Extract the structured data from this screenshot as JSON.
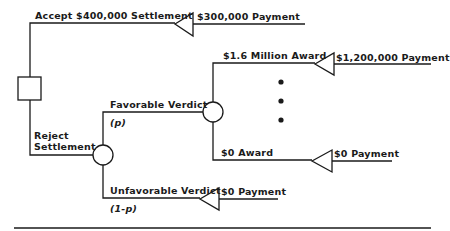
{
  "diagram": {
    "type": "decision-tree",
    "nodes": {
      "decision": {
        "shape": "square",
        "label": ""
      },
      "trial_chance": {
        "shape": "circle",
        "label": ""
      },
      "award_chance": {
        "shape": "circle",
        "label": ""
      }
    },
    "branches": {
      "accept": {
        "label": "Accept $400,000 Settlement",
        "payoff": "$300,000 Payment"
      },
      "reject": {
        "label_line1": "Reject",
        "label_line2": "Settlement"
      },
      "favorable": {
        "label": "Favorable Verdict",
        "prob": "(p)"
      },
      "unfavorable": {
        "label": "Unfavorable Verdict",
        "prob": "(1-p)",
        "payoff": "$0 Payment"
      },
      "award_high": {
        "label": "$1.6 Million Award",
        "payoff": "$1,200,000 Payment"
      },
      "award_zero": {
        "label": "$0  Award",
        "payoff": "$0 Payment"
      }
    },
    "ellipsis": "•••",
    "line_color": "#1a1a1a"
  }
}
